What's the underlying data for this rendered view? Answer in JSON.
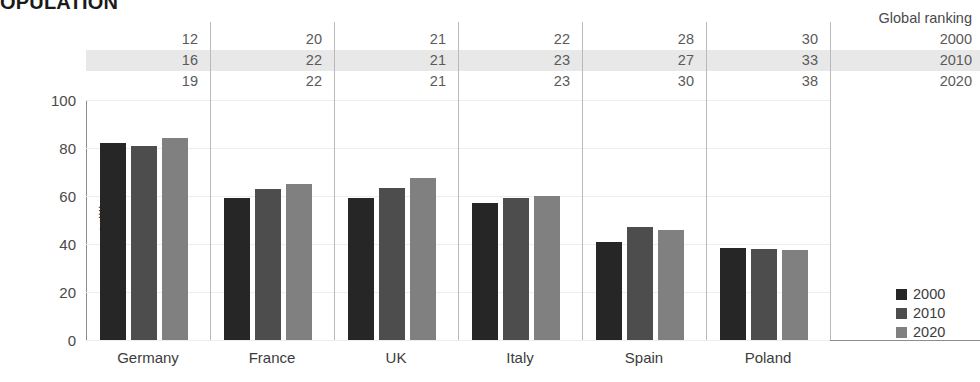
{
  "title": "OPULATION",
  "ranking": {
    "header": "Global ranking",
    "years": [
      "2000",
      "2010",
      "2020"
    ],
    "highlight_row_index": 1,
    "rows": [
      {
        "year": "2000",
        "values": [
          "12",
          "20",
          "21",
          "22",
          "28",
          "30"
        ]
      },
      {
        "year": "2010",
        "values": [
          "16",
          "22",
          "21",
          "23",
          "27",
          "33"
        ]
      },
      {
        "year": "2020",
        "values": [
          "19",
          "22",
          "21",
          "23",
          "30",
          "38"
        ]
      }
    ]
  },
  "legend": {
    "position": "right",
    "items": [
      {
        "label": "2000",
        "color": "#262626"
      },
      {
        "label": "2010",
        "color": "#4d4d4d"
      },
      {
        "label": "2020",
        "color": "#808080"
      }
    ]
  },
  "chart_data": {
    "type": "bar",
    "title": "OPULATION",
    "xlabel": "",
    "ylabel": "Millions",
    "ylim": [
      0,
      100
    ],
    "yticks": [
      "0",
      "20",
      "40",
      "60",
      "80",
      "100"
    ],
    "grid": true,
    "categories": [
      "Germany",
      "France",
      "UK",
      "Italy",
      "Spain",
      "Poland"
    ],
    "series": [
      {
        "name": "2000",
        "color": "#262626",
        "values": [
          82,
          59,
          59,
          57,
          41,
          38.5
        ]
      },
      {
        "name": "2010",
        "color": "#4d4d4d",
        "values": [
          81,
          63,
          63.5,
          59,
          47,
          38
        ]
      },
      {
        "name": "2020",
        "color": "#808080",
        "values": [
          84,
          65,
          67.5,
          60,
          46,
          37.5
        ]
      }
    ]
  }
}
